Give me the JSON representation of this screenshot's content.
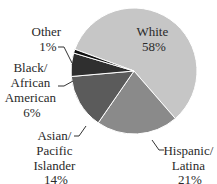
{
  "chart_data": {
    "type": "pie",
    "title": "",
    "start_angle_deg": 290.2,
    "direction": "clockwise",
    "slices": [
      {
        "label": "White",
        "value": 58,
        "display": "58%",
        "color": "#c6c6c6"
      },
      {
        "label": "Hispanic/Latina",
        "value": 21,
        "display": "21%",
        "color": "#8a8a8a"
      },
      {
        "label": "Asian/Pacific Islander",
        "value": 14,
        "display": "14%",
        "color": "#5b5b5b"
      },
      {
        "label": "Black/African American",
        "value": 6,
        "display": "6%",
        "color": "#2f2f2f"
      },
      {
        "label": "Other",
        "value": 1,
        "display": "1%",
        "color": "#111111"
      }
    ],
    "legend": "none (direct labels with leader lines)"
  },
  "labels": {
    "white": {
      "line1": "White",
      "line2": "58%"
    },
    "hispanic": {
      "line1": "Hispanic/",
      "line2": "Latina",
      "line3": "21%"
    },
    "asian": {
      "line1": "Asian/",
      "line2": "Pacific",
      "line3": "Islander",
      "line4": "14%"
    },
    "black": {
      "line1": "Black/",
      "line2": "African",
      "line3": "American",
      "line4": "6%"
    },
    "other": {
      "line1": "Other",
      "line2": "1%"
    }
  }
}
